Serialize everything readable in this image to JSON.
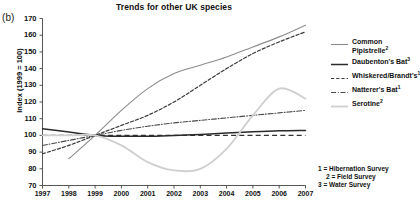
{
  "panel": {
    "label": "(b)"
  },
  "chart_data": {
    "type": "line",
    "title": "Trends for other UK species",
    "xlabel": "",
    "ylabel": "Index (1999 = 100)",
    "xlim": [
      1997,
      2007
    ],
    "ylim": [
      70,
      170
    ],
    "yticks": [
      70,
      80,
      90,
      100,
      110,
      120,
      130,
      140,
      150,
      160,
      170
    ],
    "xticks": [
      1997,
      1998,
      1999,
      2000,
      2001,
      2002,
      2003,
      2004,
      2005,
      2006,
      2007
    ],
    "grid": false,
    "legend_position": "right",
    "baseline": {
      "value": 100,
      "style": "dashed",
      "color": "#333333"
    },
    "series": [
      {
        "name": "Common Pipistrelle",
        "superscript": "2",
        "style": "solid",
        "color": "#8c8c8c",
        "width": 1.1,
        "x": [
          1998,
          1999,
          2000,
          2001,
          2002,
          2003,
          2004,
          2005,
          2006,
          2007
        ],
        "values": [
          86,
          100,
          115,
          128,
          137,
          142,
          147,
          153,
          159,
          166
        ]
      },
      {
        "name": "Daubenton's Bat",
        "superscript": "3",
        "style": "solid",
        "color": "#2b2b2b",
        "width": 1.5,
        "x": [
          1997,
          1998,
          1999,
          2000,
          2001,
          2002,
          2003,
          2004,
          2005,
          2006,
          2007
        ],
        "values": [
          104,
          102,
          100,
          99.5,
          99.5,
          100,
          100.6,
          101.4,
          102.2,
          102.8,
          103
        ]
      },
      {
        "name": "Whiskered/Brandt's",
        "superscript": "1",
        "style": "dashed",
        "color": "#3a3a3a",
        "width": 1.2,
        "x": [
          1997,
          1998,
          1999,
          2000,
          2001,
          2002,
          2003,
          2004,
          2005,
          2006,
          2007
        ],
        "values": [
          89,
          94,
          100,
          106,
          112,
          120,
          130,
          140,
          149,
          156,
          162
        ]
      },
      {
        "name": "Natterer's Bat",
        "superscript": "1",
        "style": "dashdot",
        "color": "#4a4a4a",
        "width": 1.1,
        "x": [
          1997,
          1998,
          1999,
          2000,
          2001,
          2002,
          2003,
          2004,
          2005,
          2006,
          2007
        ],
        "values": [
          94,
          97,
          100,
          103,
          105.5,
          107.5,
          109,
          110.5,
          112,
          113.5,
          115
        ]
      },
      {
        "name": "Serotine",
        "superscript": "2",
        "style": "solid",
        "color": "#cfcfcf",
        "width": 1.8,
        "x": [
          1997,
          1998,
          1999,
          2000,
          2001,
          2002,
          2003,
          2004,
          2005,
          2006,
          2007
        ],
        "values": [
          100,
          100,
          100,
          94,
          84,
          79,
          80,
          92,
          112,
          128,
          122
        ]
      }
    ]
  },
  "legend": {
    "items": [
      {
        "label": "Common Pipistrelle",
        "sup": "2",
        "key": "line-solid-gray"
      },
      {
        "label": "Daubenton's Bat",
        "sup": "3",
        "key": "line-solid-black"
      },
      {
        "label": "Whiskered/Brandt's",
        "sup": "1",
        "key": "line-dashed"
      },
      {
        "label": "Natterer's Bat",
        "sup": "1",
        "key": "line-dashdot"
      },
      {
        "label": "Serotine",
        "sup": "2",
        "key": "line-solid-lightgray"
      }
    ]
  },
  "footnotes": {
    "line1": "1 = Hibernation Survey",
    "line2": "2 = Field Survey",
    "line3": "3 = Water Survey"
  }
}
